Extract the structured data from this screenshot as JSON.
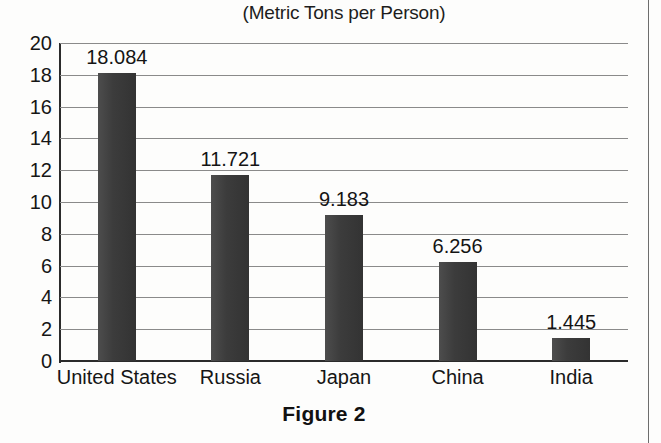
{
  "chart_data": {
    "type": "bar",
    "title": "(Metric Tons per Person)",
    "subtitle": "",
    "xlabel": "",
    "ylabel": "",
    "categories": [
      "United States",
      "Russia",
      "Japan",
      "China",
      "India"
    ],
    "values": [
      18.084,
      11.721,
      9.183,
      6.256,
      1.445
    ],
    "value_labels": [
      "18.084",
      "11.721",
      "9.183",
      "6.256",
      "1.445"
    ],
    "ylim": [
      0,
      20
    ],
    "ytick_step": 2,
    "ytick_labels": [
      "20",
      "18",
      "16",
      "14",
      "12",
      "10",
      "8",
      "6",
      "4",
      "2",
      "0"
    ],
    "ytick_values": [
      20,
      18,
      16,
      14,
      12,
      10,
      8,
      6,
      4,
      2,
      0
    ],
    "grid": true,
    "grid_orientation": "horizontal",
    "legend": false,
    "legend_position": "none",
    "bar_color": "#3b3b3b",
    "gridline_color": "#8a8a8a",
    "axis_color": "#2b2b2b",
    "text_color": "#151515"
  },
  "caption": {
    "text": "Figure 2"
  }
}
